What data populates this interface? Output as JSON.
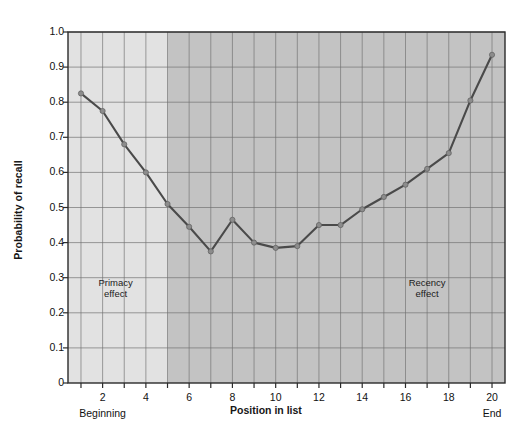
{
  "chart_data": {
    "type": "line",
    "title": "",
    "xlabel": "Position in list",
    "ylabel": "Probability of recall",
    "xlim": [
      0.4,
      20.6
    ],
    "ylim": [
      0,
      1.0
    ],
    "grid": true,
    "legend_position": "none",
    "x": [
      1,
      2,
      3,
      4,
      5,
      6,
      7,
      8,
      9,
      10,
      11,
      12,
      13,
      14,
      15,
      16,
      17,
      18,
      19,
      20
    ],
    "values": [
      0.825,
      0.775,
      0.68,
      0.6,
      0.51,
      0.445,
      0.375,
      0.465,
      0.4,
      0.385,
      0.39,
      0.45,
      0.45,
      0.495,
      0.53,
      0.565,
      0.61,
      0.655,
      0.805,
      0.935
    ],
    "series": [
      {
        "name": "Probability of recall",
        "values": [
          0.825,
          0.775,
          0.68,
          0.6,
          0.51,
          0.445,
          0.375,
          0.465,
          0.4,
          0.385,
          0.39,
          0.45,
          0.45,
          0.495,
          0.53,
          0.565,
          0.61,
          0.655,
          0.805,
          0.935
        ]
      }
    ],
    "ytick_labels": [
      "1.0",
      "0.9",
      "0.8",
      "0.7",
      "0.6",
      "0.5",
      "0.4",
      "0.3",
      "0.2",
      "0.1",
      "0"
    ],
    "ytick_values": [
      1.0,
      0.9,
      0.8,
      0.7,
      0.6,
      0.5,
      0.4,
      0.3,
      0.2,
      0.1,
      0
    ],
    "xtick_labels": [
      "2",
      "4",
      "6",
      "8",
      "10",
      "12",
      "14",
      "16",
      "18",
      "20"
    ],
    "xtick_values": [
      2,
      4,
      6,
      8,
      10,
      12,
      14,
      16,
      18,
      20
    ],
    "annotations": [
      {
        "text_line1": "Primacy",
        "text_line2": "effect",
        "x": 2.6,
        "y": 0.285
      },
      {
        "text_line1": "Recency",
        "text_line2": "effect",
        "x": 17.0,
        "y": 0.285
      }
    ],
    "axis_end_labels": [
      {
        "text": "Beginning",
        "x": 2
      },
      {
        "text": "End",
        "x": 20
      }
    ],
    "bands": [
      {
        "name": "primacy-band",
        "x_from": 0.4,
        "x_to": 5.0,
        "color": "#e2e2e2"
      },
      {
        "name": "main-band",
        "x_from": 5.0,
        "x_to": 20.6,
        "color": "#c3c3c3"
      }
    ],
    "colors": {
      "line": "#4a4a4a",
      "marker": "#8c8c8c",
      "grid": "#707070",
      "axis": "#2b2b2b",
      "plot_light": "#e2e2e2",
      "plot_dark": "#c3c3c3",
      "background": "#ffffff"
    }
  }
}
